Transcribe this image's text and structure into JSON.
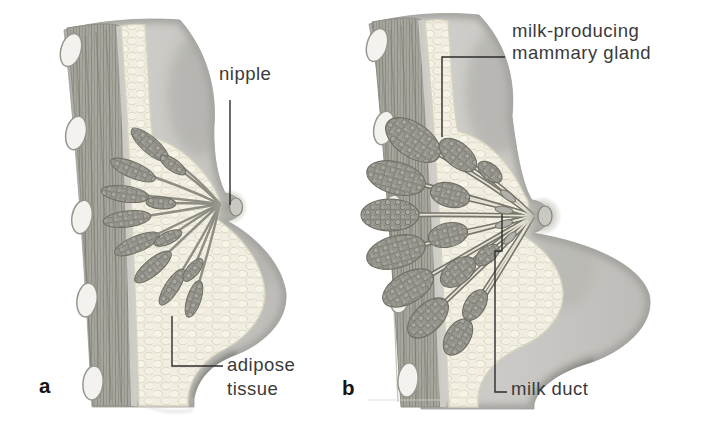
{
  "figure_kind": "anatomical cross-section diagram, breast (non-lactating vs lactating)",
  "panels": {
    "a": {
      "letter": "a",
      "labels": {
        "nipple": "nipple",
        "adipose_line1": "adipose",
        "adipose_line2": "tissue"
      }
    },
    "b": {
      "letter": "b",
      "labels": {
        "gland_line1": "milk-producing",
        "gland_line2": "mammary gland",
        "milk_duct": "milk duct"
      }
    }
  },
  "style": {
    "background": "#ffffff",
    "label_color": "#3a3a3a",
    "panel_letter_color": "#141414",
    "leader_line_color": "#2d2d2d",
    "skin_color": "#cbcac6",
    "adipose_color": "#f1eee1",
    "muscle_color": "#a7a69e",
    "gland_color": "#97968e",
    "rib_color": "#f3f2ee"
  }
}
